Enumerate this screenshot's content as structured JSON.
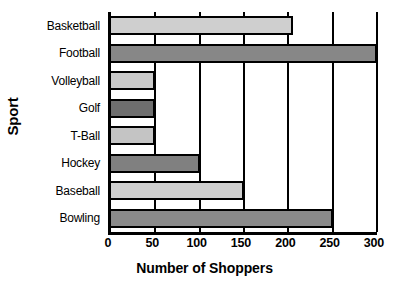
{
  "chart_data": {
    "type": "bar",
    "orientation": "horizontal",
    "title": "",
    "xlabel": "Number of Shoppers",
    "ylabel": "Sport",
    "categories": [
      "Basketball",
      "Football",
      "Volleyball",
      "Golf",
      "T-Ball",
      "Hockey",
      "Baseball",
      "Bowling"
    ],
    "values": [
      205,
      300,
      50,
      50,
      50,
      100,
      150,
      250
    ],
    "bar_colors": [
      "#cfcfcf",
      "#878787",
      "#c9c9c9",
      "#6e6e6e",
      "#c4c4c4",
      "#808080",
      "#cfcfcf",
      "#8a8a8a"
    ],
    "xlim": [
      0,
      300
    ],
    "x_ticks": [
      0,
      50,
      100,
      150,
      200,
      250,
      300
    ],
    "x_tick_labels": [
      "0",
      "50",
      "100",
      "150",
      "200",
      "250",
      "300"
    ],
    "grid": true,
    "grid_axis": "x",
    "legend": false,
    "bar_border_color": "#000000",
    "axis_color": "#000000",
    "background": "#ffffff"
  }
}
